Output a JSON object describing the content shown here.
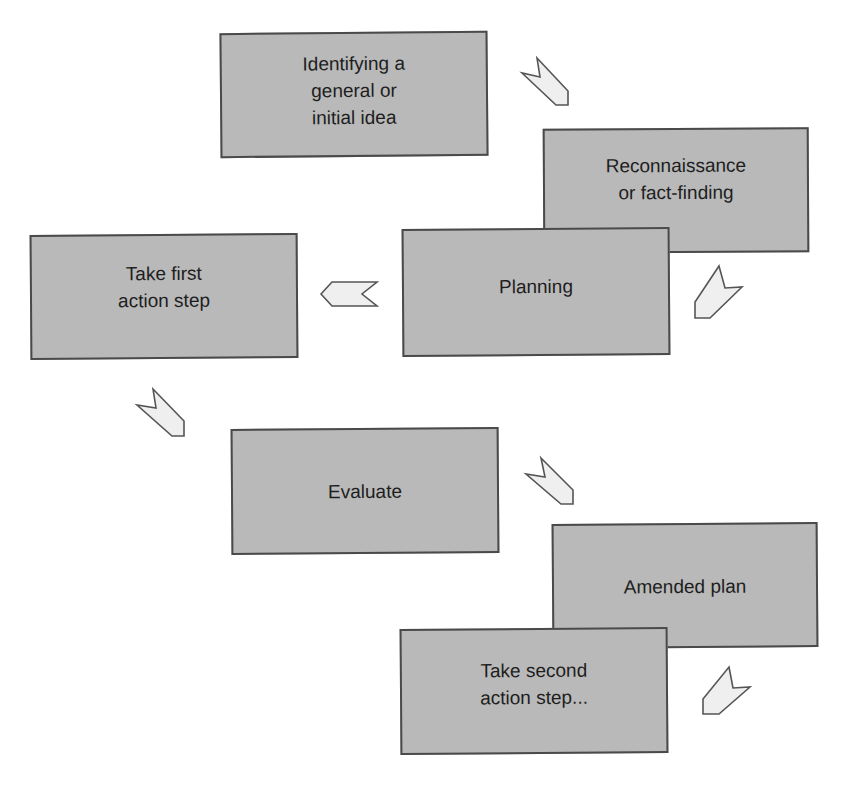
{
  "diagram": {
    "type": "action-research-cycle",
    "colors": {
      "box_fill": "#b9b9b9",
      "box_border": "#4a4a4a",
      "text": "#1e1e1e",
      "arrow_fill": "#efefef",
      "arrow_stroke": "#555555",
      "background": "#ffffff"
    },
    "steps": [
      {
        "id": "step-1",
        "label": "Identifying a\ngeneral or\ninitial idea"
      },
      {
        "id": "step-2",
        "label": "Reconnaissance\nor fact-finding"
      },
      {
        "id": "step-3",
        "label": "Planning"
      },
      {
        "id": "step-4",
        "label": "Take first\naction step"
      },
      {
        "id": "step-5",
        "label": "Evaluate"
      },
      {
        "id": "step-6",
        "label": "Amended plan"
      },
      {
        "id": "step-7",
        "label": "Take second\naction step..."
      }
    ],
    "connectors": [
      {
        "from": "step-1",
        "to": "step-2",
        "icon": "chevron-arrow-down-right-icon"
      },
      {
        "from": "step-2",
        "to": "step-3",
        "icon": "chevron-arrow-down-left-icon"
      },
      {
        "from": "step-3",
        "to": "step-4",
        "icon": "chevron-arrow-left-icon"
      },
      {
        "from": "step-4",
        "to": "step-5",
        "icon": "chevron-arrow-down-right-icon"
      },
      {
        "from": "step-5",
        "to": "step-6",
        "icon": "chevron-arrow-down-right-icon"
      },
      {
        "from": "step-6",
        "to": "step-7",
        "icon": "chevron-arrow-down-left-icon"
      }
    ]
  }
}
